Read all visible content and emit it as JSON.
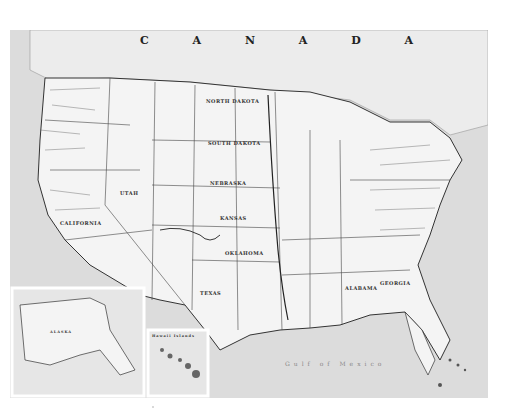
{
  "map": {
    "subject": "United States reference map (scanned, grayscale)",
    "labels": {
      "country_north": "C A N A D A",
      "state_nd": "NORTH DAKOTA",
      "state_sd": "SOUTH DAKOTA",
      "state_ks": "KANSAS",
      "state_ne": "NEBRASKA",
      "state_ut": "UTAH",
      "state_ca": "CALIFORNIA",
      "state_ok": "OKLAHOMA",
      "state_tx": "TEXAS",
      "state_al": "ALABAMA",
      "state_ga": "GEORGIA",
      "gulf": "Gulf of Mexico"
    },
    "insets": {
      "alaska_title": "ALASKA",
      "hawaii_title": "Hawaii Islands"
    },
    "colors": {
      "land": "#f4f4f4",
      "water": "#dcdcdc",
      "lines": "#333333",
      "frame": "#ececec"
    }
  }
}
